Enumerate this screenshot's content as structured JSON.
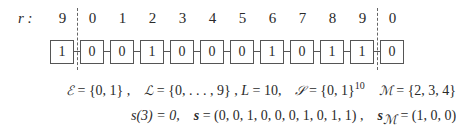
{
  "figure": {
    "row_label": "r :",
    "indices": [
      "9",
      "0",
      "1",
      "2",
      "3",
      "4",
      "5",
      "6",
      "7",
      "8",
      "9",
      "0"
    ],
    "cells": [
      "1",
      "0",
      "0",
      "1",
      "0",
      "0",
      "0",
      "1",
      "0",
      "1",
      "1",
      "0"
    ],
    "wrap_markers": [
      "left-periodic-boundary",
      "right-periodic-boundary"
    ]
  },
  "equations": {
    "line1": {
      "E_sym": "ℰ",
      "E_val": " = {0, 1} ,",
      "L_sym": "ℒ",
      "L_val": " = {0, . . . , 9} ,",
      "Lnum_sym": "L",
      "Lnum_val": " = 10,",
      "S_sym": "𝒮",
      "S_val": " = {0, 1}",
      "S_exp": "10",
      "M_sym": "ℳ",
      "M_val": " = {2, 3, 4}"
    },
    "line2": {
      "s3": "s(3) = 0,",
      "s_sym": "s",
      "s_val": " = (0, 0, 1, 0, 0, 0, 1, 0, 1, 1) ,",
      "sM_sym": "s",
      "sM_sub": "ℳ",
      "sM_val": " = (1, 0, 0)"
    }
  }
}
